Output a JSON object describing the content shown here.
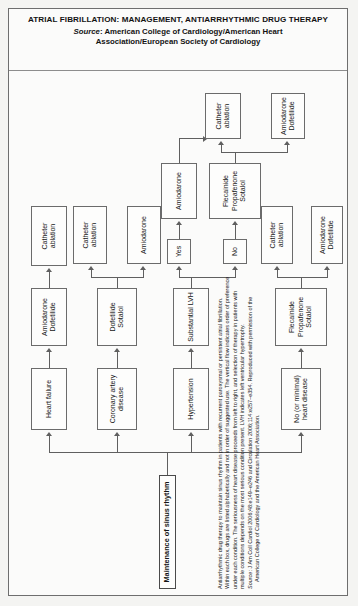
{
  "title": {
    "line1": "ATRIAL FIBRILLATION: MANAGEMENT, ANTIARRHYTHMIC",
    "line2": "DRUG THERAPY",
    "source_word": "Source",
    "source_line1": ": American College of Cardiology/American Heart",
    "source_line2": "Association/European Society of Cardiology"
  },
  "flowchart": {
    "root": "Maintenance of sinus rhythm",
    "nodes": {
      "no_minimal_heart_disease": "No (or minimal) heart disease",
      "hypertension": "Hypertension",
      "coronary_artery_disease": "Coronary artery disease",
      "heart_failure": "Heart failure",
      "substantial_lvh": "Substantial LVH",
      "yes": "Yes",
      "no": "No",
      "flecainide_1": "Flecainide Propafenone Sotalol",
      "flecainide_1_l1": "Flecainide",
      "flecainide_1_l2": "Propafenone",
      "flecainide_1_l3": "Sotalol",
      "flecainide_2_l1": "Flecainide",
      "flecainide_2_l2": "Propafenone",
      "flecainide_2_l3": "Sotalol",
      "amiodarone_yes": "Amiodarone",
      "amiodarone_hyper": "Amiodarone",
      "amiodarone_cad": "Amiodarone",
      "dofetilide_sotalol_l1": "Dofetilide",
      "dofetilide_sotalol_l2": "Sotalol",
      "amiodarone_dofetilide_a_l1": "Amiodarone",
      "amiodarone_dofetilide_a_l2": "Dofetilide",
      "amiodarone_dofetilide_b_l1": "Amiodarone",
      "amiodarone_dofetilide_b_l2": "Dofetilide",
      "amiodarone_dofetilide_c_l1": "Amiodarone",
      "amiodarone_dofetilide_c_l2": "Dofetilide",
      "catheter_ablation_1_l1": "Catheter",
      "catheter_ablation_1_l2": "ablation",
      "catheter_ablation_2": "Catheter ablation",
      "catheter_ablation_3": "Catheter ablation",
      "catheter_ablation_4": "Catheter ablation",
      "catheter_ablation_5": "Catheter ablation"
    }
  },
  "footnote": {
    "line1": "Antiarrhythmic drug therapy to maintain sinus rhythm in patients with recurrent paroxysmal or persistent atrial fibrillation.",
    "line2": "Within each box, drugs are listed alphabetically and not in order of suggested use. The vertical flow indicates order of preference",
    "line3": "under each condition. The seriousness of heart disease proceeds from left to right, and selection of therapy in patients with",
    "line4": "multiple conditions depends on the most serious condition present. LVH indicates left ventricular hypertrophy.",
    "source_label": "Source",
    "line5": ": J Am Coll Cardiol 2006;48:e149–e246 and Circulation 2006;114:e257–e354. Reproduced with permission of the",
    "line6": "American College of Cardiology and the American Heart Association."
  }
}
